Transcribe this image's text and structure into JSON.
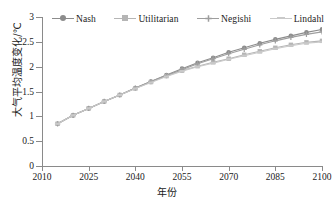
{
  "chart_data": {
    "type": "line",
    "title": "",
    "xlabel": "年份",
    "ylabel": "大气平均温度变化/℃",
    "xlim": [
      2010,
      2100
    ],
    "ylim": [
      0,
      3
    ],
    "xticks": [
      2010,
      2025,
      2040,
      2055,
      2070,
      2085,
      2100
    ],
    "yticks": [
      0,
      0.5,
      1,
      1.5,
      2,
      2.5,
      3
    ],
    "ytick_labels": [
      "0",
      "0.5",
      "1",
      "1.5",
      "2",
      "2.5",
      "3"
    ],
    "xtick_labels": [
      "2010",
      "2025",
      "2040",
      "2055",
      "2070",
      "2085",
      "2100"
    ],
    "grid": false,
    "legend_position": "top-center",
    "x": [
      2015,
      2020,
      2025,
      2030,
      2035,
      2040,
      2045,
      2050,
      2055,
      2060,
      2065,
      2070,
      2075,
      2080,
      2085,
      2090,
      2095,
      2100
    ],
    "series": [
      {
        "name": "Nash",
        "color": "#8c8c8c",
        "marker": "circle",
        "values": [
          0.85,
          1.02,
          1.16,
          1.3,
          1.43,
          1.57,
          1.7,
          1.83,
          1.96,
          2.08,
          2.18,
          2.29,
          2.38,
          2.47,
          2.55,
          2.62,
          2.69,
          2.75
        ]
      },
      {
        "name": "Utilitarian",
        "color": "#b5b5b5",
        "marker": "square",
        "values": [
          0.85,
          1.02,
          1.16,
          1.3,
          1.43,
          1.56,
          1.69,
          1.81,
          1.92,
          2.01,
          2.09,
          2.16,
          2.24,
          2.31,
          2.38,
          2.44,
          2.49,
          2.52
        ]
      },
      {
        "name": "Negishi",
        "color": "#9e9e9e",
        "marker": "plus",
        "values": [
          0.85,
          1.02,
          1.16,
          1.3,
          1.43,
          1.57,
          1.7,
          1.82,
          1.94,
          2.06,
          2.16,
          2.26,
          2.35,
          2.44,
          2.52,
          2.59,
          2.65,
          2.7
        ]
      },
      {
        "name": "Lindahl",
        "color": "#c9c9c9",
        "marker": "dash",
        "values": [
          0.85,
          1.02,
          1.16,
          1.3,
          1.43,
          1.56,
          1.68,
          1.8,
          1.91,
          2.0,
          2.07,
          2.15,
          2.22,
          2.29,
          2.36,
          2.42,
          2.47,
          2.5
        ]
      }
    ]
  },
  "legend": {
    "items": [
      {
        "label": "Nash",
        "color": "#8c8c8c",
        "marker": "circle"
      },
      {
        "label": "Utilitarian",
        "color": "#b5b5b5",
        "marker": "square"
      },
      {
        "label": "Negishi",
        "color": "#9e9e9e",
        "marker": "plus"
      },
      {
        "label": "Lindahl",
        "color": "#c9c9c9",
        "marker": "dash"
      }
    ]
  },
  "axes": {
    "y_title": "大气平均温度变化/℃",
    "x_title": "年份"
  }
}
